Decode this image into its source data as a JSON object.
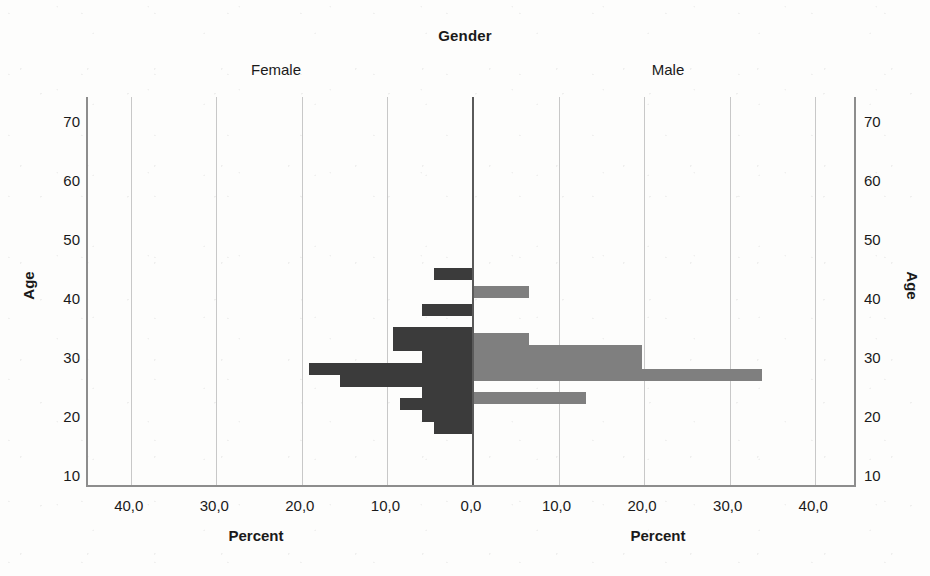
{
  "chart_data": {
    "type": "bar",
    "subtype": "population-pyramid",
    "title": "Gender",
    "xlabel": "Percent",
    "ylabel": "Age",
    "grid": true,
    "legend_position": "none",
    "panels": [
      {
        "name": "Female",
        "side": "left",
        "color": "#3b3b3b"
      },
      {
        "name": "Male",
        "side": "right",
        "color": "#7f7f7f"
      }
    ],
    "ylim": [
      8,
      74
    ],
    "ytick_labels": [
      "10",
      "20",
      "30",
      "40",
      "50",
      "60",
      "70"
    ],
    "ytick_values": [
      10,
      20,
      30,
      40,
      50,
      60,
      70
    ],
    "xlim": [
      -45,
      45
    ],
    "xtick_labels": [
      "40,0",
      "30,0",
      "20,0",
      "10,0",
      "0,0",
      "10,0",
      "20,0",
      "30,0",
      "40,0"
    ],
    "xtick_values": [
      -40,
      -30,
      -20,
      -10,
      0,
      10,
      20,
      30,
      40
    ],
    "series": [
      {
        "name": "Female",
        "color": "#3b3b3b",
        "direction": "left",
        "categories": [
          44,
          38,
          34,
          32,
          30,
          28,
          26,
          24,
          22,
          20,
          18
        ],
        "values": [
          4.6,
          6.0,
          9.4,
          9.4,
          6.0,
          19.2,
          15.5,
          6.0,
          8.5,
          6.0,
          4.6
        ]
      },
      {
        "name": "Male",
        "color": "#7f7f7f",
        "direction": "right",
        "categories": [
          41,
          33,
          31,
          29,
          27,
          23
        ],
        "values": [
          6.5,
          6.5,
          19.8,
          19.8,
          33.8,
          13.2
        ]
      }
    ]
  },
  "chart": {
    "title": "Gender",
    "panel_female_label": "Female",
    "panel_male_label": "Male",
    "xaxis_title_female": "Percent",
    "xaxis_title_male": "Percent",
    "yaxis_title_left": "Age",
    "yaxis_title_right": "Age"
  },
  "colors": {
    "female_bar": "#3b3b3b",
    "male_bar": "#7f7f7f",
    "gridline": "#c8c8c8",
    "center_axis": "#5a5a5a",
    "frame": "#8d8d8d",
    "background": "#fdfdfc",
    "text": "#1a1a1a"
  }
}
